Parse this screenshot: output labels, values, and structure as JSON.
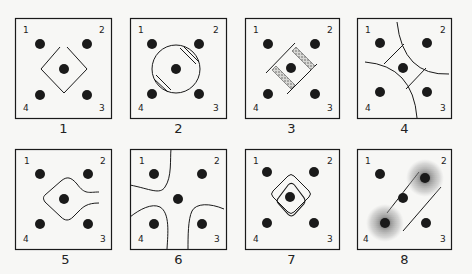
{
  "figure": {
    "panels": [
      {
        "id": "1",
        "caption": "1",
        "x": 15,
        "y": 18,
        "shape": "diamond"
      },
      {
        "id": "2",
        "caption": "2",
        "x": 130,
        "y": 18,
        "shape": "circle-with-hatches"
      },
      {
        "id": "3",
        "caption": "3",
        "x": 245,
        "y": 18,
        "shape": "diagonal-band-stippled"
      },
      {
        "id": "4",
        "caption": "4",
        "x": 357,
        "y": 18,
        "shape": "curved-diamond-arcs"
      },
      {
        "id": "5",
        "caption": "5",
        "x": 15,
        "y": 149,
        "shape": "teardrop-open-right"
      },
      {
        "id": "6",
        "caption": "6",
        "x": 130,
        "y": 149,
        "shape": "four-corner-lobes"
      },
      {
        "id": "7",
        "caption": "7",
        "x": 245,
        "y": 149,
        "shape": "double-rounded-diamond"
      },
      {
        "id": "8",
        "caption": "8",
        "x": 357,
        "y": 149,
        "shape": "diagonal-band-stippled-dots"
      }
    ],
    "corner_labels": {
      "top_left": "1",
      "top_right": "2",
      "bottom_right": "3",
      "bottom_left": "4"
    },
    "colors": {
      "ink": "#1a1a1a",
      "paper": "#f7f7f5",
      "stipple": "#777777"
    }
  }
}
